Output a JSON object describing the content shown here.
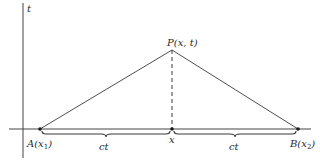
{
  "diagram": {
    "axes": {
      "t_label": "t"
    },
    "points": {
      "P": {
        "label": "P(x, t)"
      },
      "A": {
        "label": "A(x",
        "sub": "1",
        "close": ")"
      },
      "B": {
        "label": "B(x",
        "sub": "2",
        "close": ")"
      },
      "x": {
        "label": "x"
      }
    },
    "braces": {
      "left_label": "ct",
      "right_label": "ct"
    },
    "colors": {
      "line": "#3a3a3a",
      "point": "#1a1a1a",
      "text": "#2a2a2a",
      "background": "#ffffff"
    }
  }
}
